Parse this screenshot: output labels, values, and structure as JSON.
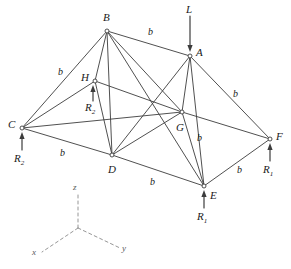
{
  "figure": {
    "stroke_color": "#3c3c3c",
    "node_fill": "#ffffff",
    "axis_color": "#8a8a8a",
    "nodes": [
      {
        "id": "A",
        "label": "A",
        "x": 190,
        "y": 56,
        "label_x": 196,
        "label_y": 47
      },
      {
        "id": "B",
        "label": "B",
        "x": 107,
        "y": 31,
        "label_x": 103,
        "label_y": 12
      },
      {
        "id": "C",
        "label": "C",
        "x": 22,
        "y": 128,
        "label_x": 8,
        "label_y": 119
      },
      {
        "id": "D",
        "label": "D",
        "x": 112,
        "y": 155,
        "label_x": 108,
        "label_y": 164
      },
      {
        "id": "E",
        "label": "E",
        "x": 204,
        "y": 186,
        "label_x": 210,
        "label_y": 190
      },
      {
        "id": "F",
        "label": "F",
        "x": 270,
        "y": 139,
        "label_x": 276,
        "label_y": 131
      },
      {
        "id": "G",
        "label": "G",
        "x": 182,
        "y": 112,
        "label_x": 176,
        "label_y": 122
      },
      {
        "id": "H",
        "label": "H",
        "x": 95,
        "y": 81,
        "label_x": 81,
        "label_y": 72
      }
    ],
    "members": [
      {
        "from": "C",
        "to": "D",
        "name": "member-cd"
      },
      {
        "from": "D",
        "to": "E",
        "name": "member-de"
      },
      {
        "from": "E",
        "to": "F",
        "name": "member-ef"
      },
      {
        "from": "F",
        "to": "A",
        "name": "member-fa"
      },
      {
        "from": "A",
        "to": "B",
        "name": "member-ab"
      },
      {
        "from": "B",
        "to": "C",
        "name": "member-bc"
      },
      {
        "from": "C",
        "to": "H",
        "name": "member-ch"
      },
      {
        "from": "H",
        "to": "G",
        "name": "member-hg"
      },
      {
        "from": "G",
        "to": "F",
        "name": "member-gf"
      },
      {
        "from": "C",
        "to": "G",
        "name": "member-cg"
      },
      {
        "from": "B",
        "to": "H",
        "name": "member-bh"
      },
      {
        "from": "B",
        "to": "D",
        "name": "member-bd"
      },
      {
        "from": "B",
        "to": "E",
        "name": "member-be"
      },
      {
        "from": "B",
        "to": "G",
        "name": "member-bg"
      },
      {
        "from": "A",
        "to": "D",
        "name": "member-ad"
      },
      {
        "from": "A",
        "to": "E",
        "name": "member-ae"
      },
      {
        "from": "A",
        "to": "G",
        "name": "member-ag"
      },
      {
        "from": "G",
        "to": "D",
        "name": "member-gd"
      },
      {
        "from": "G",
        "to": "E",
        "name": "member-ge"
      },
      {
        "from": "H",
        "to": "D",
        "name": "member-hd"
      }
    ],
    "dimension_labels": [
      {
        "id": "b-ba",
        "text": "b",
        "x": 148,
        "y": 27
      },
      {
        "id": "b-cb",
        "text": "b",
        "x": 58,
        "y": 67
      },
      {
        "id": "b-af",
        "text": "b",
        "x": 233,
        "y": 89
      },
      {
        "id": "b-cd",
        "text": "b",
        "x": 60,
        "y": 148
      },
      {
        "id": "b-de",
        "text": "b",
        "x": 150,
        "y": 177
      },
      {
        "id": "b-ef",
        "text": "b",
        "x": 237,
        "y": 165
      },
      {
        "id": "b-ge",
        "text": "b",
        "x": 197,
        "y": 133
      }
    ],
    "forces": [
      {
        "id": "load-L",
        "label": "L",
        "sub": "",
        "label_x": 186,
        "label_y": 4,
        "x1": 190,
        "y1": 16,
        "x2": 190,
        "y2": 52,
        "dir": "down",
        "name": "load-arrow-l"
      },
      {
        "id": "react-R2-C",
        "label": "R",
        "sub": "2",
        "label_x": 14,
        "label_y": 153,
        "x1": 22,
        "y1": 150,
        "x2": 22,
        "y2": 132,
        "dir": "up",
        "name": "reaction-arrow-r2-c"
      },
      {
        "id": "react-R2-H",
        "label": "R",
        "sub": "2",
        "label_x": 85,
        "label_y": 102,
        "x1": 93,
        "y1": 101,
        "x2": 93,
        "y2": 85,
        "dir": "up",
        "name": "reaction-arrow-r2-h"
      },
      {
        "id": "react-R1-E",
        "label": "R",
        "sub": "1",
        "label_x": 197,
        "label_y": 211,
        "x1": 204,
        "y1": 208,
        "x2": 204,
        "y2": 190,
        "dir": "up",
        "name": "reaction-arrow-r1-e"
      },
      {
        "id": "react-R1-F",
        "label": "R",
        "sub": "1",
        "label_x": 263,
        "label_y": 164,
        "x1": 270,
        "y1": 161,
        "x2": 270,
        "y2": 143,
        "dir": "up",
        "name": "reaction-arrow-r1-f"
      }
    ],
    "axes": {
      "origin": {
        "x": 78,
        "y": 228
      },
      "z": {
        "x": 78,
        "y": 192,
        "label": "z",
        "label_x": 73,
        "label_y": 183
      },
      "y": {
        "x": 120,
        "y": 248,
        "label": "y",
        "label_x": 122,
        "label_y": 244
      },
      "x": {
        "x": 42,
        "y": 252,
        "label": "x",
        "label_x": 32,
        "label_y": 248
      }
    }
  }
}
